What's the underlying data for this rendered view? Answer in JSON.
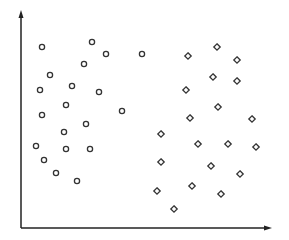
{
  "chart_data": {
    "type": "scatter",
    "title": "",
    "xlabel": "",
    "ylabel": "",
    "grid": false,
    "legend": null,
    "axis_style": "arrows, no ticks, no labels",
    "xlim": [
      0,
      250
    ],
    "ylim": [
      0,
      218
    ],
    "series": [
      {
        "name": "class-circle",
        "marker": "circle",
        "color": "#333333",
        "points": [
          [
            21,
            181
          ],
          [
            71,
            186
          ],
          [
            85,
            174
          ],
          [
            121,
            174
          ],
          [
            29,
            153
          ],
          [
            63,
            164
          ],
          [
            19,
            138
          ],
          [
            51,
            142
          ],
          [
            78,
            136
          ],
          [
            45,
            123
          ],
          [
            21,
            113
          ],
          [
            101,
            117
          ],
          [
            65,
            104
          ],
          [
            43,
            96
          ],
          [
            15,
            82
          ],
          [
            45,
            79
          ],
          [
            69,
            79
          ],
          [
            23,
            68
          ],
          [
            35,
            55
          ],
          [
            56,
            47
          ]
        ]
      },
      {
        "name": "class-diamond",
        "marker": "diamond",
        "color": "#333333",
        "points": [
          [
            196,
            181
          ],
          [
            167,
            172
          ],
          [
            216,
            168
          ],
          [
            192,
            151
          ],
          [
            216,
            147
          ],
          [
            165,
            138
          ],
          [
            197,
            121
          ],
          [
            169,
            110
          ],
          [
            231,
            109
          ],
          [
            140,
            94
          ],
          [
            177,
            84
          ],
          [
            207,
            84
          ],
          [
            235,
            81
          ],
          [
            140,
            66
          ],
          [
            190,
            62
          ],
          [
            219,
            54
          ],
          [
            136,
            37
          ],
          [
            171,
            42
          ],
          [
            200,
            34
          ],
          [
            153,
            19
          ]
        ]
      }
    ]
  },
  "plot": {
    "origin_px": [
      21,
      228
    ],
    "x_axis_end_px": 272,
    "y_axis_top_px": 10,
    "axis_color": "#222222",
    "marker_color": "#333333"
  }
}
